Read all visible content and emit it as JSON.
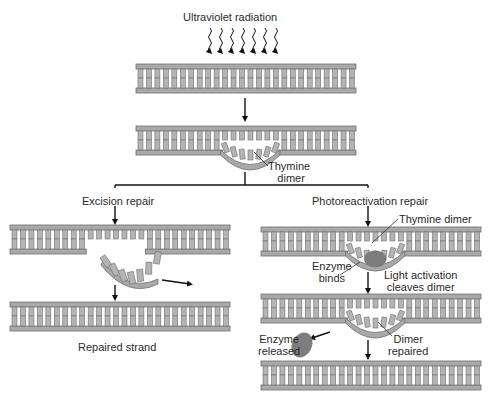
{
  "diagram": {
    "colors": {
      "backbone": "#a9a9a9",
      "backbone_stroke": "#6e6e6e",
      "base": "#b4b4b4",
      "base_stroke": "#707070",
      "enzyme": "#7d7d7d",
      "line": "#111111",
      "text": "#2a2a2a"
    },
    "labels": {
      "uv": "Ultraviolet radiation",
      "thymine_dimer_line1": "Thymine",
      "thymine_dimer_line2": "dimer",
      "excision_repair": "Excision repair",
      "photoreactivation_repair": "Photoreactivation repair",
      "repaired_strand": "Repaired strand",
      "thymine_dimer_right": "Thymine dimer",
      "enzyme_binds_line1": "Enzyme",
      "enzyme_binds_line2": "binds",
      "light_activation_line1": "Light activation",
      "light_activation_line2": "cleaves dimer",
      "enzyme_released_line1": "Enzyme",
      "enzyme_released_line2": "released",
      "dimer_repaired_line1": "Dimer",
      "dimer_repaired_line2": "repaired"
    },
    "nodes": [
      {
        "id": "intact-dna-top",
        "x": 136,
        "y": 64
      },
      {
        "id": "damaged-dna",
        "x": 136,
        "y": 126
      },
      {
        "id": "excision-cut-dna",
        "x": 10,
        "y": 225
      },
      {
        "id": "excision-repaired-dna",
        "x": 10,
        "y": 302
      },
      {
        "id": "photo-enzyme-bound-dna",
        "x": 261,
        "y": 227
      },
      {
        "id": "photo-cleaved-dna",
        "x": 261,
        "y": 294
      },
      {
        "id": "photo-repaired-dna",
        "x": 261,
        "y": 361
      }
    ],
    "uv_wave_count": 7
  }
}
